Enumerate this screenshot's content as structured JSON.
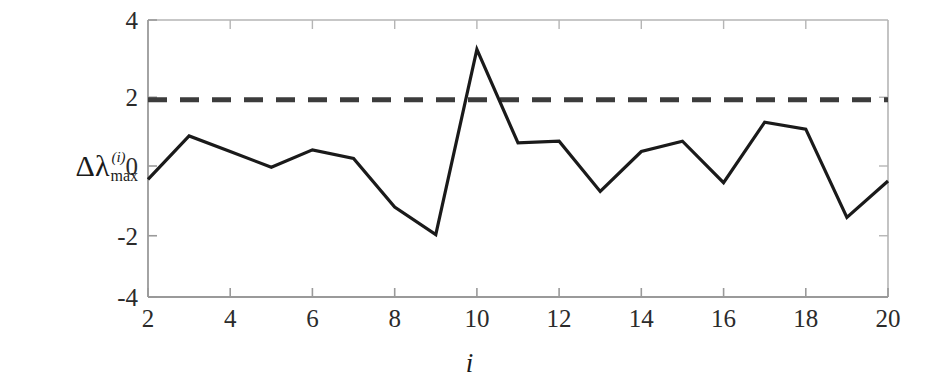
{
  "chart_data": {
    "type": "line",
    "title": "",
    "xlabel": "i",
    "ylabel": "Δλ",
    "ylabel_superscript": "(i)",
    "ylabel_subscript": "max",
    "x": [
      2,
      3,
      4,
      5,
      6,
      7,
      8,
      9,
      10,
      11,
      12,
      13,
      14,
      15,
      16,
      17,
      18,
      19,
      20
    ],
    "values": [
      -0.6,
      0.65,
      0.2,
      -0.25,
      0.25,
      0.0,
      -1.4,
      -2.2,
      3.15,
      0.45,
      0.5,
      -0.95,
      0.2,
      0.5,
      -0.7,
      1.05,
      0.85,
      -1.7,
      -0.65
    ],
    "series": [
      {
        "name": "delta-lambda-max",
        "values": [
          -0.6,
          0.65,
          0.2,
          -0.25,
          0.25,
          0.0,
          -1.4,
          -2.2,
          3.15,
          0.45,
          0.5,
          -0.95,
          0.2,
          0.5,
          -0.7,
          1.05,
          0.85,
          -1.7,
          -0.65
        ],
        "color": "#1a1a1a",
        "style": "solid"
      },
      {
        "name": "threshold",
        "value": 1.7,
        "color": "#3c3c3c",
        "style": "dashed"
      }
    ],
    "xlim": [
      2,
      20
    ],
    "ylim": [
      -4,
      4
    ],
    "xticks": [
      2,
      4,
      6,
      8,
      10,
      12,
      14,
      16,
      18,
      20
    ],
    "xtick_labels": [
      "2",
      "4",
      "6",
      "8",
      "10",
      "12",
      "14",
      "16",
      "18",
      "20"
    ],
    "yticks": [
      -4,
      -2,
      0,
      2,
      4
    ],
    "ytick_labels": [
      "-4",
      "-2",
      "0",
      "2",
      "4"
    ],
    "grid": false,
    "legend": "none",
    "box": true,
    "colors": {
      "line": "#1a1a1a",
      "threshold": "#3c3c3c",
      "axis": "#9a9a9a",
      "tick_text": "#2b2b2b",
      "background": "#ffffff"
    }
  }
}
